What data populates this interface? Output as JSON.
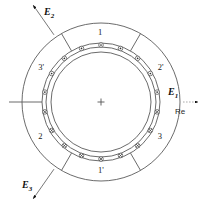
{
  "figure": {
    "type": "machine-cross-section",
    "title": "",
    "center_marker": "+",
    "stroke_color": "#5a5a5a",
    "text_color": "#1a1a1a"
  },
  "geometry": {
    "center_x": 101,
    "center_y": 102,
    "outer_radius": 79,
    "stator_inner_radius": 59,
    "bore_outer_radius": 55,
    "bore_inner_radius": 50,
    "conductor_radius": 57,
    "conductor_dot_size": 4.6
  },
  "sectors": [
    {
      "label": "1",
      "name": "sector-1",
      "angle_deg": 90,
      "label_radius": 69,
      "polarity": "out"
    },
    {
      "label": "2'",
      "name": "sector-2-prime",
      "angle_deg": 30,
      "label_radius": 69,
      "polarity": "out"
    },
    {
      "label": "3",
      "name": "sector-3",
      "angle_deg": -30,
      "label_radius": 69,
      "polarity": "in"
    },
    {
      "label": "1'",
      "name": "sector-1-prime",
      "angle_deg": -90,
      "label_radius": 69,
      "polarity": "in"
    },
    {
      "label": "2",
      "name": "sector-2",
      "angle_deg": -150,
      "label_radius": 69,
      "polarity": "in"
    },
    {
      "label": "3'",
      "name": "sector-3-prime",
      "angle_deg": 150,
      "label_radius": 69,
      "polarity": "out"
    }
  ],
  "sector_boundaries_deg": [
    0,
    60,
    120,
    180,
    240,
    300
  ],
  "conductors": {
    "count": 18,
    "start_angle_deg": 10,
    "step_deg": 20,
    "out_symbol": "dot",
    "in_symbol": "cross",
    "out_meaning": "current out of page",
    "in_meaning": "current into page",
    "angles_deg": [
      10,
      30,
      50,
      70,
      90,
      110,
      130,
      150,
      170,
      190,
      210,
      230,
      250,
      270,
      290,
      310,
      330,
      350
    ]
  },
  "phasors": [
    {
      "name": "phasor-e1",
      "label": "E",
      "sub": "1",
      "angle_deg": 0,
      "label_x": 168,
      "label_y": 87,
      "arrow_from_r": 82,
      "arrow_to_r": 97
    },
    {
      "name": "phasor-e2",
      "label": "E",
      "sub": "2",
      "angle_deg": 125,
      "label_x": 44,
      "label_y": 7,
      "arrow_from_r": 82,
      "arrow_to_r": 118
    },
    {
      "name": "phasor-e3",
      "label": "E",
      "sub": "3",
      "angle_deg": -125,
      "label_x": 22,
      "label_y": 180,
      "arrow_from_r": 82,
      "arrow_to_r": 118
    }
  ],
  "axes": {
    "real_axis_label": "Re",
    "real_axis_label_x": 175,
    "real_axis_label_y": 108,
    "horizontal_line_left_from": 9,
    "horizontal_line_left_to": 42,
    "horizontal_line_right_from": 160,
    "horizontal_line_right_to": 193
  }
}
